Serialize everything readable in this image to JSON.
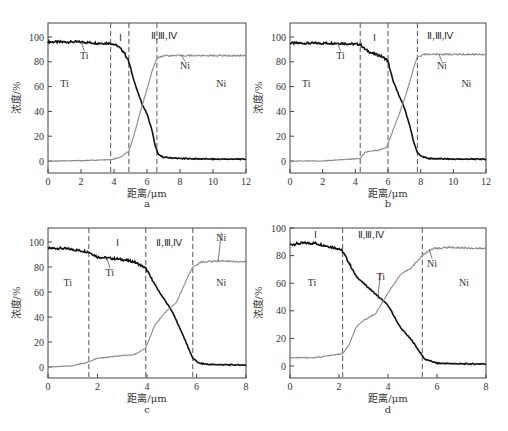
{
  "figure": {
    "ylabel": "浓度/%",
    "xlabel": "距离/μm"
  },
  "chart_data": [
    {
      "type": "line",
      "panel": "a",
      "xlabel": "距离/μm",
      "ylabel": "浓度/%",
      "xlim": [
        0,
        12
      ],
      "ylim": [
        -8,
        110
      ],
      "xticks": [
        0,
        2,
        4,
        6,
        8,
        10,
        12
      ],
      "yticks": [
        0,
        20,
        40,
        60,
        80,
        100
      ],
      "boundaries": [
        3.8,
        4.9,
        6.6
      ],
      "region_labels": [
        {
          "text": "Ti",
          "x": 1.0,
          "y": 60
        },
        {
          "text": "Ⅰ",
          "x": 4.4,
          "y": 97
        },
        {
          "text": "Ⅱ,Ⅲ,Ⅳ",
          "x": 7.0,
          "y": 98
        },
        {
          "text": "Ni",
          "x": 10.5,
          "y": 60
        }
      ],
      "curve_labels": [
        {
          "text": "Ti",
          "x": 2.2,
          "y": 82
        },
        {
          "text": "Ni",
          "x": 8.3,
          "y": 74
        }
      ],
      "series": [
        {
          "name": "Ti",
          "color": "#111111",
          "x": [
            0,
            1,
            2,
            3,
            3.8,
            4.2,
            4.6,
            4.9,
            5.1,
            5.4,
            5.7,
            6.0,
            6.3,
            6.5,
            6.7,
            7.0,
            8,
            10,
            12
          ],
          "y": [
            96,
            96,
            96,
            95,
            95,
            93,
            88,
            80,
            70,
            57,
            46,
            38,
            25,
            12,
            5,
            3,
            2,
            1.5,
            1.5
          ]
        },
        {
          "name": "Ni",
          "color": "#888888",
          "x": [
            0,
            2,
            3.8,
            4.4,
            4.9,
            5.2,
            5.6,
            6.0,
            6.3,
            6.6,
            7.0,
            8,
            10,
            12
          ],
          "y": [
            0,
            0.3,
            1,
            3,
            8,
            20,
            40,
            58,
            72,
            83,
            85,
            85,
            85,
            85
          ]
        }
      ]
    },
    {
      "type": "line",
      "panel": "b",
      "xlabel": "距离/μm",
      "ylabel": "浓度/%",
      "xlim": [
        0,
        12
      ],
      "ylim": [
        -8,
        110
      ],
      "xticks": [
        0,
        2,
        4,
        6,
        8,
        10,
        12
      ],
      "yticks": [
        0,
        20,
        40,
        60,
        80,
        100
      ],
      "boundaries": [
        4.3,
        6.0,
        7.8
      ],
      "region_labels": [
        {
          "text": "Ti",
          "x": 1.0,
          "y": 60
        },
        {
          "text": "Ⅰ",
          "x": 5.2,
          "y": 97
        },
        {
          "text": "Ⅱ,Ⅲ,Ⅳ",
          "x": 9.2,
          "y": 98
        },
        {
          "text": "Ni",
          "x": 10.8,
          "y": 60
        }
      ],
      "curve_labels": [
        {
          "text": "Ti",
          "x": 3.1,
          "y": 82
        },
        {
          "text": "Ni",
          "x": 9.3,
          "y": 74
        }
      ],
      "series": [
        {
          "name": "Ti",
          "color": "#111111",
          "x": [
            0,
            1,
            2,
            3,
            4.3,
            4.6,
            5.0,
            5.5,
            5.9,
            6.0,
            6.3,
            6.7,
            7.0,
            7.3,
            7.6,
            7.8,
            8.0,
            8.5,
            10,
            12
          ],
          "y": [
            95,
            95,
            95,
            95,
            94,
            90,
            87,
            85,
            82,
            80,
            65,
            52,
            43,
            30,
            14,
            7,
            4,
            2,
            1.5,
            1.5
          ]
        },
        {
          "name": "Ni",
          "color": "#888888",
          "x": [
            0,
            2,
            4.3,
            4.6,
            5.0,
            5.5,
            5.9,
            6.0,
            6.4,
            6.8,
            7.2,
            7.6,
            7.8,
            8.2,
            10,
            12
          ],
          "y": [
            0,
            0,
            2,
            7,
            8,
            9,
            11,
            14,
            28,
            42,
            58,
            76,
            84,
            86,
            86,
            86
          ]
        }
      ]
    },
    {
      "type": "line",
      "panel": "c",
      "xlabel": "距离/μm",
      "ylabel": "浓度/%",
      "xlim": [
        0,
        8
      ],
      "ylim": [
        -8,
        110
      ],
      "xticks": [
        0,
        2,
        4,
        6,
        8
      ],
      "yticks": [
        0,
        20,
        40,
        60,
        80,
        100
      ],
      "boundaries": [
        1.65,
        3.95,
        5.85
      ],
      "region_labels": [
        {
          "text": "Ti",
          "x": 0.8,
          "y": 65
        },
        {
          "text": "Ⅰ",
          "x": 2.8,
          "y": 97
        },
        {
          "text": "Ⅱ,Ⅲ,Ⅳ",
          "x": 4.9,
          "y": 97
        },
        {
          "text": "Ni",
          "x": 7.0,
          "y": 65
        }
      ],
      "curve_labels": [
        {
          "text": "Ti",
          "x": 2.5,
          "y": 73
        },
        {
          "text": "Ni",
          "x": 7.0,
          "y": 101
        }
      ],
      "series": [
        {
          "name": "Ti",
          "color": "#111111",
          "x": [
            0,
            0.5,
            1.0,
            1.65,
            2.0,
            2.5,
            3.0,
            3.5,
            3.95,
            4.2,
            4.5,
            5.0,
            5.4,
            5.7,
            5.85,
            6.1,
            6.5,
            8
          ],
          "y": [
            95,
            95,
            94,
            92,
            88,
            87,
            86,
            84,
            79,
            70,
            60,
            45,
            28,
            14,
            7,
            3,
            2,
            1.5
          ]
        },
        {
          "name": "Ni",
          "color": "#888888",
          "x": [
            0,
            1.0,
            1.65,
            2.0,
            2.5,
            3.0,
            3.5,
            3.95,
            4.3,
            4.7,
            5.2,
            5.6,
            5.85,
            6.2,
            7,
            8
          ],
          "y": [
            0,
            1,
            4,
            7,
            8,
            9,
            10,
            15,
            33,
            43,
            52,
            70,
            80,
            84,
            85,
            84
          ]
        }
      ]
    },
    {
      "type": "line",
      "panel": "d",
      "xlabel": "距离/μm",
      "ylabel": "浓度/%",
      "xlim": [
        0,
        8
      ],
      "ylim": [
        -8,
        100
      ],
      "xticks": [
        0,
        2,
        4,
        6,
        8
      ],
      "yticks": [
        0,
        20,
        40,
        60,
        80,
        100
      ],
      "boundaries": [
        2.15,
        5.4
      ],
      "region_labels": [
        {
          "text": "Ti",
          "x": 0.9,
          "y": 58
        },
        {
          "text": "Ⅰ",
          "x": 1.05,
          "y": 93
        },
        {
          "text": "Ⅱ,Ⅲ,Ⅳ",
          "x": 3.3,
          "y": 93
        },
        {
          "text": "Ni",
          "x": 7.1,
          "y": 58
        }
      ],
      "curve_labels": [
        {
          "text": "Ti",
          "x": 3.7,
          "y": 62
        },
        {
          "text": "Ni",
          "x": 5.8,
          "y": 72
        }
      ],
      "series": [
        {
          "name": "Ti",
          "color": "#111111",
          "x": [
            0,
            0.5,
            1.0,
            1.5,
            2.0,
            2.15,
            2.4,
            2.7,
            3.0,
            3.5,
            4.0,
            4.5,
            5.0,
            5.3,
            5.5,
            6.0,
            7,
            8
          ],
          "y": [
            88,
            89,
            89,
            87,
            85,
            83,
            75,
            65,
            60,
            52,
            44,
            28,
            18,
            10,
            5,
            2,
            1.5,
            1.5
          ]
        },
        {
          "name": "Ni",
          "color": "#888888",
          "x": [
            0,
            1.0,
            1.8,
            2.15,
            2.4,
            2.7,
            3.0,
            3.5,
            4.0,
            4.5,
            5.0,
            5.4,
            5.8,
            6.5,
            8
          ],
          "y": [
            6,
            6,
            8,
            9,
            15,
            28,
            33,
            38,
            53,
            66,
            72,
            80,
            85,
            86,
            85
          ]
        }
      ]
    }
  ],
  "panel_captions": [
    "a",
    "b",
    "c",
    "d"
  ]
}
